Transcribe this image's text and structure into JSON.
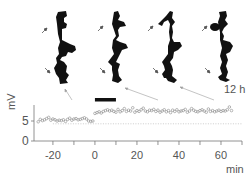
{
  "panels": [
    {
      "index": 1,
      "label": ""
    },
    {
      "index": 2,
      "label": ""
    },
    {
      "index": 3,
      "label": ""
    },
    {
      "index": 4,
      "label": "12 h"
    }
  ],
  "stimulus_bar": {
    "start_min": 0,
    "end_min": 10,
    "color": "#111111"
  },
  "colors": {
    "axis": "#777777",
    "dendrite": "#111111",
    "marker": "#888888",
    "baseline": "#aaaaaa",
    "connector": "#999999"
  },
  "chart_data": {
    "type": "scatter",
    "title": "",
    "xlabel": "min",
    "ylabel": "mV",
    "xlim": [
      -29,
      70
    ],
    "ylim": [
      0,
      9
    ],
    "xticks": [
      -20,
      0,
      20,
      40,
      60
    ],
    "xtick_labels": [
      "-20",
      "0",
      "20",
      "40",
      "60"
    ],
    "xminor_ticks": [
      -10,
      10,
      30,
      50,
      70
    ],
    "yticks": [
      0,
      5
    ],
    "ytick_labels": [
      "0",
      "5"
    ],
    "grid": false,
    "baseline_mV": 4.3,
    "marker": "open-circle",
    "series": [
      {
        "name": "EPSP amplitude",
        "x": [
          -27,
          -26,
          -25,
          -24,
          -23,
          -22,
          -21,
          -20,
          -19,
          -18,
          -17,
          -16,
          -15,
          -14,
          -13,
          -12,
          -11,
          -10,
          -9,
          -8,
          -7,
          -6,
          -5,
          -4,
          -3,
          -2,
          -1,
          0,
          1,
          2,
          3,
          4,
          5,
          6,
          7,
          8,
          9,
          10,
          11,
          12,
          13,
          14,
          15,
          16,
          17,
          18,
          19,
          20,
          21,
          22,
          23,
          24,
          25,
          26,
          27,
          28,
          29,
          30,
          31,
          32,
          33,
          34,
          35,
          36,
          37,
          38,
          39,
          40,
          41,
          42,
          43,
          44,
          45,
          46,
          47,
          48,
          49,
          50,
          51,
          52,
          53,
          54,
          55,
          56,
          57,
          58,
          59,
          60,
          61,
          62,
          63,
          64,
          65
        ],
        "y": [
          4.8,
          5.4,
          5.1,
          5.3,
          5.6,
          5.9,
          5.2,
          5.5,
          5.3,
          5.0,
          5.2,
          5.1,
          5.3,
          4.9,
          5.4,
          5.7,
          5.2,
          5.5,
          5.6,
          5.3,
          5.4,
          5.6,
          5.8,
          5.5,
          5.0,
          4.9,
          5.0,
          6.9,
          7.1,
          7.3,
          7.0,
          7.4,
          7.6,
          7.8,
          7.5,
          7.7,
          7.4,
          7.2,
          7.9,
          7.3,
          7.6,
          8.1,
          7.4,
          7.7,
          7.5,
          8.3,
          7.2,
          7.6,
          7.4,
          7.8,
          8.2,
          7.5,
          7.3,
          7.7,
          7.6,
          7.9,
          7.4,
          7.7,
          7.2,
          7.5,
          7.8,
          7.3,
          7.6,
          7.1,
          7.7,
          7.4,
          7.8,
          7.3,
          7.5,
          7.6,
          7.9,
          7.2,
          7.5,
          8.1,
          7.7,
          7.4,
          7.3,
          7.6,
          7.8,
          7.5,
          7.2,
          8.0,
          7.4,
          7.6,
          7.3,
          7.5,
          7.7,
          7.4,
          7.6,
          7.5,
          7.8,
          8.5,
          7.6
        ]
      }
    ]
  }
}
